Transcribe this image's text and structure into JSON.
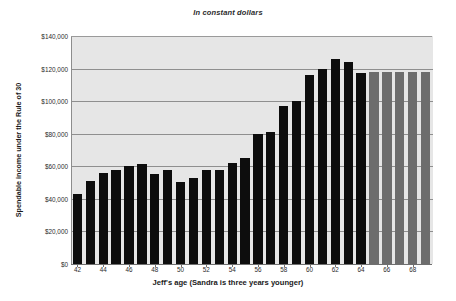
{
  "chart_data": {
    "type": "bar",
    "title": "In constant dollars",
    "xlabel": "Jeff's age (Sandra is three years younger)",
    "ylabel": "Spendable income under the Rule of 30",
    "ylim": [
      0,
      140000
    ],
    "grid": true,
    "legend": "none",
    "y_ticks": [
      "$0",
      "$20,000",
      "$40,000",
      "$60,000",
      "$80,000",
      "$100,000",
      "$120,000",
      "$140,000"
    ],
    "y_tick_values": [
      0,
      20000,
      40000,
      60000,
      80000,
      100000,
      120000,
      140000
    ],
    "x_tick_labels": [
      "42",
      "44",
      "46",
      "48",
      "50",
      "52",
      "54",
      "56",
      "58",
      "60",
      "62",
      "64",
      "66",
      "68"
    ],
    "categories": [
      42,
      43,
      44,
      45,
      46,
      47,
      48,
      49,
      50,
      51,
      52,
      53,
      54,
      55,
      56,
      57,
      58,
      59,
      60,
      61,
      62,
      63,
      64,
      65,
      66,
      67,
      68,
      69
    ],
    "values": [
      43000,
      51000,
      56000,
      58000,
      60000,
      61500,
      55000,
      58000,
      50500,
      53000,
      58000,
      57500,
      62000,
      65000,
      80000,
      81000,
      97000,
      100000,
      116000,
      120000,
      126000,
      124000,
      117000,
      118000,
      118000,
      118000,
      118000,
      118000
    ],
    "bar_colors": [
      "dark",
      "dark",
      "dark",
      "dark",
      "dark",
      "dark",
      "dark",
      "dark",
      "dark",
      "dark",
      "dark",
      "dark",
      "dark",
      "dark",
      "dark",
      "dark",
      "dark",
      "dark",
      "dark",
      "dark",
      "dark",
      "dark",
      "dark",
      "gray",
      "gray",
      "gray",
      "gray",
      "gray"
    ],
    "colors": {
      "bar_dark": "#0d0d0d",
      "bar_gray": "#6d6d6d",
      "plot_background": "#e6e6e6",
      "gridline": "#8f8f8f",
      "page_background": "#ffffff",
      "text": "#1a1a1a"
    }
  }
}
